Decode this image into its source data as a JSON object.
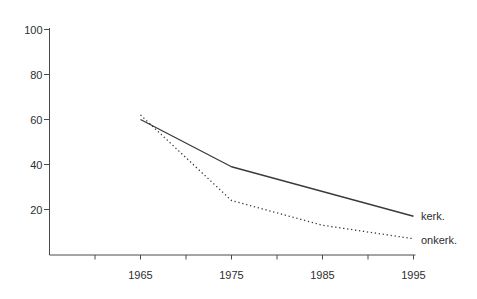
{
  "chart_data": {
    "type": "line",
    "title": "",
    "xlabel": "",
    "ylabel": "",
    "x": [
      1965,
      1975,
      1985,
      1995
    ],
    "x_tick_labels": [
      "1965",
      "1975",
      "1985",
      "1995"
    ],
    "x_axis_start": 1955,
    "x_minor_tick_step": 5,
    "y_ticks": [
      20,
      40,
      60,
      80,
      100
    ],
    "y_tick_labels": [
      "20",
      "40",
      "60",
      "80",
      "100"
    ],
    "ylim": [
      0,
      100
    ],
    "xlim": [
      1955,
      1997
    ],
    "grid": false,
    "series": [
      {
        "name": "kerk.",
        "line_style": "solid",
        "values": [
          60,
          39,
          28,
          17
        ]
      },
      {
        "name": "onkerk.",
        "line_style": "dotted",
        "values": [
          62,
          24,
          13,
          7
        ]
      }
    ],
    "legend_position": "labels-at-line-ends-right",
    "colors": {
      "line": "#3a3a3a",
      "axis": "#4a4a4a",
      "text": "#2e2e2e",
      "background": "#ffffff"
    }
  }
}
